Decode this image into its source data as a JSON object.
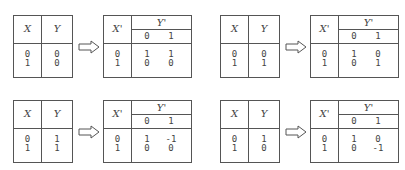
{
  "headers": {
    "x": "X",
    "y": "Y",
    "x_prime": "X'",
    "y_prime": "Y'",
    "y_prime_sub": [
      "0",
      "1"
    ]
  },
  "arrow_icon": "right-arrow-icon",
  "panels": [
    {
      "input": {
        "x": [
          "0",
          "1"
        ],
        "y": [
          "0",
          "0"
        ]
      },
      "output": {
        "x_prime": [
          "0",
          "1"
        ],
        "rows": [
          [
            "1",
            "1"
          ],
          [
            "0",
            "0"
          ]
        ]
      }
    },
    {
      "input": {
        "x": [
          "0",
          "1"
        ],
        "y": [
          "0",
          "1"
        ]
      },
      "output": {
        "x_prime": [
          "0",
          "1"
        ],
        "rows": [
          [
            "1",
            "0"
          ],
          [
            "0",
            "1"
          ]
        ]
      }
    },
    {
      "input": {
        "x": [
          "0",
          "1"
        ],
        "y": [
          "1",
          "1"
        ]
      },
      "output": {
        "x_prime": [
          "0",
          "1"
        ],
        "rows": [
          [
            "1",
            "-1"
          ],
          [
            "0",
            "0"
          ]
        ]
      }
    },
    {
      "input": {
        "x": [
          "0",
          "1"
        ],
        "y": [
          "1",
          "0"
        ]
      },
      "output": {
        "x_prime": [
          "0",
          "1"
        ],
        "rows": [
          [
            "1",
            "0"
          ],
          [
            "0",
            "-1"
          ]
        ]
      }
    }
  ]
}
